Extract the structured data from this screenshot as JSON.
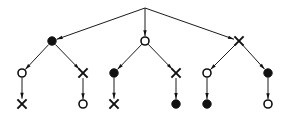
{
  "diagram": {
    "title": "Directed tree diagram",
    "type": "tree",
    "background_color": "#ffffff",
    "stroke_color": "#111111",
    "fill_filled": "#111111",
    "fill_open": "#ffffff",
    "width": 291,
    "height": 117,
    "node_glyphs": {
      "filled_circle": "●",
      "open_circle": "○",
      "cross": "✕"
    },
    "levels": [
      {
        "name": "root",
        "y": 8
      },
      {
        "name": "level-1",
        "y": 41
      },
      {
        "name": "level-2",
        "y": 73
      },
      {
        "name": "level-3",
        "y": 104
      }
    ],
    "nodes": [
      {
        "id": "n0",
        "label": "root",
        "shape": "point",
        "x": 145,
        "y": 8,
        "level": 0
      },
      {
        "id": "n1",
        "label": "A",
        "shape": "filled_circle",
        "x": 52,
        "y": 41,
        "level": 1
      },
      {
        "id": "n2",
        "label": "B",
        "shape": "open_circle",
        "x": 145,
        "y": 41,
        "level": 1
      },
      {
        "id": "n3",
        "label": "C",
        "shape": "cross",
        "x": 239,
        "y": 41,
        "level": 1
      },
      {
        "id": "n4",
        "label": "A1",
        "shape": "open_circle",
        "x": 22,
        "y": 73,
        "level": 2
      },
      {
        "id": "n5",
        "label": "A2",
        "shape": "cross",
        "x": 83,
        "y": 73,
        "level": 2
      },
      {
        "id": "n6",
        "label": "B1",
        "shape": "filled_circle",
        "x": 114,
        "y": 73,
        "level": 2
      },
      {
        "id": "n7",
        "label": "B2",
        "shape": "cross",
        "x": 176,
        "y": 73,
        "level": 2
      },
      {
        "id": "n8",
        "label": "C1",
        "shape": "open_circle",
        "x": 207,
        "y": 73,
        "level": 2
      },
      {
        "id": "n9",
        "label": "C2",
        "shape": "filled_circle",
        "x": 268,
        "y": 73,
        "level": 2
      },
      {
        "id": "n10",
        "label": "A1a",
        "shape": "cross",
        "x": 22,
        "y": 104,
        "level": 3
      },
      {
        "id": "n11",
        "label": "A2a",
        "shape": "open_circle",
        "x": 83,
        "y": 104,
        "level": 3
      },
      {
        "id": "n12",
        "label": "B1a",
        "shape": "cross",
        "x": 114,
        "y": 104,
        "level": 3
      },
      {
        "id": "n13",
        "label": "B2a",
        "shape": "filled_circle",
        "x": 176,
        "y": 104,
        "level": 3
      },
      {
        "id": "n14",
        "label": "C1a",
        "shape": "filled_circle",
        "x": 207,
        "y": 104,
        "level": 3
      },
      {
        "id": "n15",
        "label": "C2a",
        "shape": "open_circle",
        "x": 268,
        "y": 104,
        "level": 3
      }
    ],
    "edges": [
      {
        "from": "n0",
        "to": "n1",
        "directed": true
      },
      {
        "from": "n0",
        "to": "n2",
        "directed": true
      },
      {
        "from": "n0",
        "to": "n3",
        "directed": true
      },
      {
        "from": "n1",
        "to": "n4",
        "directed": true
      },
      {
        "from": "n1",
        "to": "n5",
        "directed": true
      },
      {
        "from": "n2",
        "to": "n6",
        "directed": true
      },
      {
        "from": "n2",
        "to": "n7",
        "directed": true
      },
      {
        "from": "n3",
        "to": "n8",
        "directed": true
      },
      {
        "from": "n3",
        "to": "n9",
        "directed": true
      },
      {
        "from": "n4",
        "to": "n10",
        "directed": true
      },
      {
        "from": "n5",
        "to": "n11",
        "directed": true
      },
      {
        "from": "n6",
        "to": "n12",
        "directed": true
      },
      {
        "from": "n7",
        "to": "n13",
        "directed": true
      },
      {
        "from": "n8",
        "to": "n14",
        "directed": true
      },
      {
        "from": "n9",
        "to": "n15",
        "directed": true
      }
    ],
    "geometry": {
      "circle_radius_filled": 4.2,
      "circle_radius_open": 4.0,
      "cross_arm": 4.6,
      "arrow_length": 6.0,
      "arrow_width": 3.4,
      "node_gap": 4.8
    }
  }
}
